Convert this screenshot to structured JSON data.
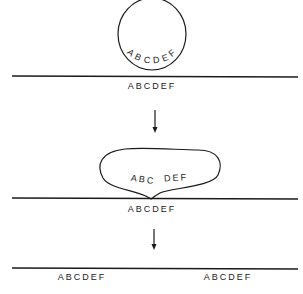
{
  "diagram": {
    "stage1": {
      "loop_label_chars": [
        "A",
        "B",
        "C",
        "D",
        "E",
        "F"
      ],
      "line_label": "ABCDEF"
    },
    "stage2": {
      "loop_label_left": "ABC",
      "loop_label_right": "DEF",
      "line_label": "ABCDEF"
    },
    "stage3": {
      "line_label_left": "ABCDEF",
      "line_label_right": "ABCDEF"
    },
    "colors": {
      "stroke": "#1a1a1a",
      "text": "#222222",
      "background": "#ffffff"
    }
  }
}
